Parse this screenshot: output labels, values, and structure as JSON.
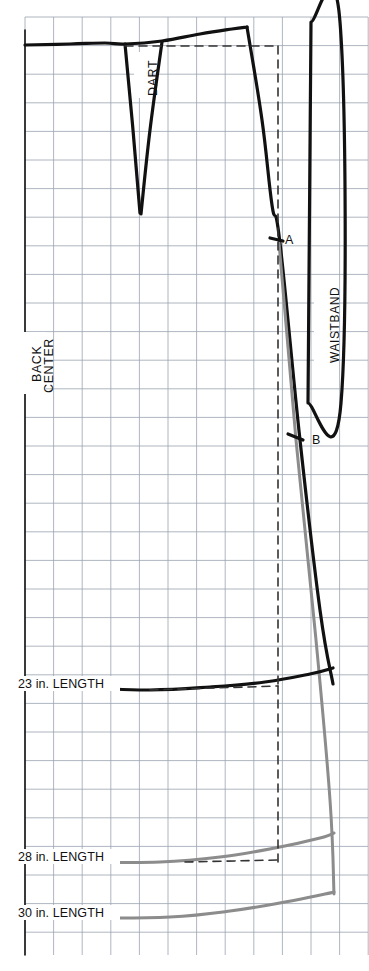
{
  "document": {
    "kind": "sewing-pattern-draft",
    "title": "Skirt Back Pattern Draft"
  },
  "labels": {
    "dart": "DART",
    "center_back_line1": "CENTER",
    "center_back_line2": "BACK",
    "waistband": "WAISTBAND",
    "point_a": "A",
    "point_b": "B",
    "length_23": "23 in. LENGTH",
    "length_28": "28 in. LENGTH",
    "length_30": "30 in. LENGTH"
  },
  "colors": {
    "paper": "#ffffff",
    "grid": "#9aa3b0",
    "pattern_line": "#111111",
    "alt_length_line": "#8c8c8c",
    "text": "#111111"
  },
  "grid": {
    "visible": true,
    "cell_px": 28.6,
    "left": 25,
    "top": 17,
    "right": 368,
    "bottom": 955,
    "cols": 12,
    "rows": 33
  },
  "chart_data": {
    "type": "line",
    "xlabel": "",
    "ylabel": "",
    "grid": true,
    "legend_position": "none",
    "annotations": [
      {
        "text": "DART",
        "x": 141,
        "y": 90,
        "rotation": -90
      },
      {
        "text": "CENTER BACK",
        "x": 30,
        "y": 355,
        "rotation": -90
      },
      {
        "text": "WAISTBAND",
        "x": 323,
        "y": 322,
        "rotation": -90
      },
      {
        "text": "A",
        "x": 288,
        "y": 241,
        "rotation": 0
      },
      {
        "text": "B",
        "x": 316,
        "y": 441,
        "rotation": 0
      },
      {
        "text": "23 in. LENGTH",
        "x": 20,
        "y": 686,
        "rotation": 0
      },
      {
        "text": "28 in. LENGTH",
        "x": 20,
        "y": 859,
        "rotation": 0
      },
      {
        "text": "30 in. LENGTH",
        "x": 20,
        "y": 915,
        "rotation": 0
      }
    ],
    "series": [
      {
        "name": "waistline",
        "color": "#111111",
        "width": 3.2,
        "points": [
          [
            25,
            45
          ],
          [
            70,
            44
          ],
          [
            105,
            43
          ],
          [
            125,
            44
          ],
          [
            162,
            41
          ],
          [
            200,
            34
          ],
          [
            232,
            29
          ],
          [
            247,
            27
          ]
        ]
      },
      {
        "name": "dart-left-leg",
        "color": "#111111",
        "width": 3.2,
        "points": [
          [
            125,
            44
          ],
          [
            133,
            130
          ],
          [
            140,
            213
          ]
        ]
      },
      {
        "name": "dart-right-leg",
        "color": "#111111",
        "width": 3.2,
        "points": [
          [
            162,
            42
          ],
          [
            150,
            130
          ],
          [
            141,
            214
          ]
        ]
      },
      {
        "name": "side-seam-black",
        "color": "#111111",
        "width": 3.2,
        "points": [
          [
            247,
            27
          ],
          [
            262,
            120
          ],
          [
            272,
            205
          ],
          [
            280,
            243
          ],
          [
            300,
            440
          ],
          [
            320,
            610
          ],
          [
            333,
            684
          ]
        ]
      },
      {
        "name": "side-seam-gray-extension",
        "color": "#8c8c8c",
        "width": 3.0,
        "points": [
          [
            279,
            243
          ],
          [
            296,
            440
          ],
          [
            316,
            640
          ],
          [
            330,
            800
          ],
          [
            334,
            894
          ]
        ]
      },
      {
        "name": "hem-23in",
        "color": "#111111",
        "width": 3.2,
        "points": [
          [
            25,
            686
          ],
          [
            90,
            688
          ],
          [
            150,
            690
          ],
          [
            210,
            687
          ],
          [
            265,
            682
          ],
          [
            310,
            674
          ],
          [
            333,
            668
          ]
        ]
      },
      {
        "name": "hem-28in",
        "color": "#8c8c8c",
        "width": 3.0,
        "points": [
          [
            25,
            860
          ],
          [
            95,
            862
          ],
          [
            160,
            862
          ],
          [
            220,
            857
          ],
          [
            275,
            848
          ],
          [
            320,
            838
          ],
          [
            334,
            833
          ]
        ]
      },
      {
        "name": "hem-30in",
        "color": "#8c8c8c",
        "width": 3.0,
        "points": [
          [
            25,
            916
          ],
          [
            100,
            918
          ],
          [
            170,
            917
          ],
          [
            230,
            911
          ],
          [
            285,
            902
          ],
          [
            325,
            894
          ],
          [
            334,
            892
          ]
        ]
      },
      {
        "name": "center-back-axis",
        "color": "#111111",
        "width": 1.6,
        "points": [
          [
            25,
            30
          ],
          [
            25,
            955
          ]
        ]
      },
      {
        "name": "dashed-guide-horizontal-waist",
        "color": "#333333",
        "width": 1.6,
        "dash": "8 6",
        "points": [
          [
            125,
            46
          ],
          [
            278,
            46
          ]
        ]
      },
      {
        "name": "dashed-guide-vertical",
        "color": "#333333",
        "width": 1.6,
        "dash": "8 6",
        "points": [
          [
            278,
            46
          ],
          [
            278,
            686
          ]
        ]
      },
      {
        "name": "dashed-guide-horizontal-23",
        "color": "#333333",
        "width": 1.6,
        "dash": "8 6",
        "points": [
          [
            150,
            690
          ],
          [
            278,
            686
          ]
        ]
      },
      {
        "name": "dashed-guide-vertical-lower",
        "color": "#333333",
        "width": 1.6,
        "dash": "8 6",
        "points": [
          [
            278,
            686
          ],
          [
            278,
            862
          ]
        ]
      },
      {
        "name": "dashed-guide-horizontal-28",
        "color": "#333333",
        "width": 1.6,
        "dash": "8 6",
        "points": [
          [
            185,
            862
          ],
          [
            278,
            860
          ]
        ]
      },
      {
        "name": "waistband-rectangle",
        "color": "#111111",
        "width": 3.2,
        "closed": true,
        "points": [
          [
            311,
            22
          ],
          [
            340,
            22
          ],
          [
            341,
            403
          ],
          [
            308,
            403
          ]
        ]
      },
      {
        "name": "tick-mark-a",
        "color": "#111111",
        "width": 3.2,
        "points": [
          [
            270,
            238
          ],
          [
            283,
            241
          ]
        ]
      },
      {
        "name": "tick-mark-b",
        "color": "#111111",
        "width": 3.2,
        "points": [
          [
            288,
            434
          ],
          [
            303,
            440
          ]
        ]
      }
    ],
    "measurements": [
      {
        "label": "23 in. LENGTH",
        "inches": 23
      },
      {
        "label": "28 in. LENGTH",
        "inches": 28
      },
      {
        "label": "30 in. LENGTH",
        "inches": 30
      }
    ],
    "markers": [
      {
        "label": "A",
        "x": 277,
        "y": 240
      },
      {
        "label": "B",
        "x": 296,
        "y": 437
      }
    ]
  }
}
